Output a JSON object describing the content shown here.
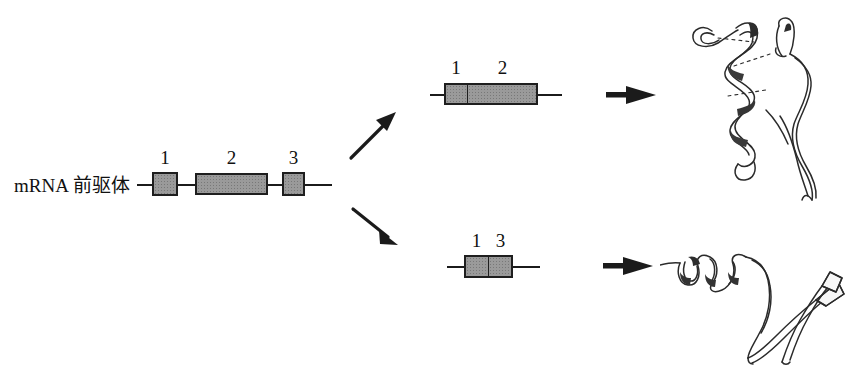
{
  "figure": {
    "background_color": "#ffffff",
    "ink_color": "#1b1b1b",
    "exon_fill_color": "#9a9a9a"
  },
  "pre_mrna": {
    "label": "mRNA 前驱体",
    "exons": [
      {
        "number": "1"
      },
      {
        "number": "2"
      },
      {
        "number": "3"
      }
    ]
  },
  "spliced_top": {
    "exons": [
      {
        "number": "1"
      },
      {
        "number": "2"
      }
    ]
  },
  "spliced_bottom": {
    "exons": [
      {
        "number": "1"
      },
      {
        "number": "3"
      }
    ]
  },
  "arrows": {
    "splice_up": "splice-arrow-up",
    "splice_down": "splice-arrow-down",
    "translate_top": "translation-arrow-top",
    "translate_bottom": "translation-arrow-bottom"
  },
  "proteins": {
    "top": {
      "name": "protein-isoform-long"
    },
    "bottom": {
      "name": "protein-isoform-short"
    }
  }
}
